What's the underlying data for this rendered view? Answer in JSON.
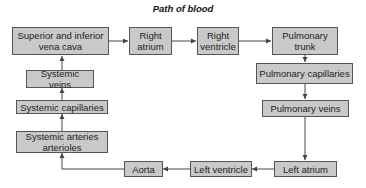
{
  "diagram": {
    "title": "Path of blood",
    "colors": {
      "box_fill": "#c9c9c9",
      "box_border": "#555555",
      "arrow": "#444444",
      "text": "#222222"
    },
    "nodes": {
      "vena_cava": {
        "label": "Superior and inferior\nvena cava"
      },
      "right_atrium": {
        "label": "Right\natrium"
      },
      "right_ventricle": {
        "label": "Right\nventricle"
      },
      "pulmonary_trunk": {
        "label": "Pulmonary\ntrunk"
      },
      "pulmonary_capillaries": {
        "label": "Pulmonary capillaries"
      },
      "pulmonary_veins": {
        "label": "Pulmonary veins"
      },
      "left_atrium": {
        "label": "Left atrium"
      },
      "left_ventricle": {
        "label": "Left ventricle"
      },
      "aorta": {
        "label": "Aorta"
      },
      "systemic_arteries_arterioles": {
        "label": "Systemic arteries\narterioles"
      },
      "systemic_capillaries": {
        "label": "Systemic capillaries"
      },
      "systemic_veins": {
        "label": "Systemic veins"
      }
    },
    "edges": [
      {
        "from": "vena_cava",
        "to": "right_atrium"
      },
      {
        "from": "right_atrium",
        "to": "right_ventricle"
      },
      {
        "from": "right_ventricle",
        "to": "pulmonary_trunk"
      },
      {
        "from": "pulmonary_trunk",
        "to": "pulmonary_capillaries"
      },
      {
        "from": "pulmonary_capillaries",
        "to": "pulmonary_veins"
      },
      {
        "from": "pulmonary_veins",
        "to": "left_atrium"
      },
      {
        "from": "left_atrium",
        "to": "left_ventricle"
      },
      {
        "from": "left_ventricle",
        "to": "aorta"
      },
      {
        "from": "aorta",
        "to": "systemic_arteries_arterioles"
      },
      {
        "from": "systemic_arteries_arterioles",
        "to": "systemic_capillaries"
      },
      {
        "from": "systemic_capillaries",
        "to": "systemic_veins"
      },
      {
        "from": "systemic_veins",
        "to": "vena_cava"
      }
    ]
  }
}
